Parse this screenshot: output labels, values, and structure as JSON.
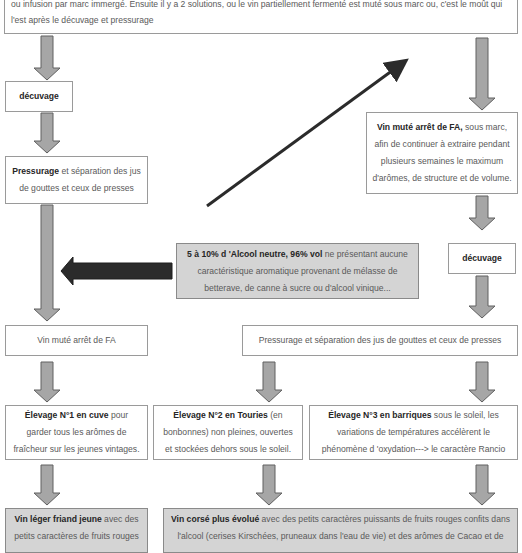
{
  "intro": {
    "text": "ou infusion par marc immergé. Ensuite il y a 2 solutions, ou le vin partiellement fermenté est muté sous marc ou, c'est le moût qui l'est après le décuvage et pressurage"
  },
  "left_branch": {
    "decuvage": "décuvage",
    "pressurage_bold": "Pressurage",
    "pressurage_rest": " et séparation des jus de gouttes et ceux de presses",
    "vin_mute": "Vin muté arrêt de FA"
  },
  "right_branch": {
    "vin_mute_bold": "Vin muté arrêt de FA,",
    "vin_mute_rest": " sous marc, afin de continuer à extraire pendant plusieurs semaines le maximum d'arômes, de structure et de volume.",
    "decuvage": "décuvage",
    "pressurage": "Pressurage et séparation des jus de gouttes et ceux de presses"
  },
  "alcool": {
    "bold": "5 à 10% d 'Alcool neutre, 96% vol",
    "rest": " ne présentant aucune caractéristique aromatique provenant de mélasse de betterave, de canne à sucre ou d'alcool vinique..."
  },
  "elevages": [
    {
      "bold": "Élevage N°1 en cuve",
      "rest": " pour garder tous les arômes de fraîcheur sur les jeunes vintages."
    },
    {
      "bold": "Élevage N°2 en Touries",
      "rest": " (en bonbonnes) non pleines, ouvertes et stockées dehors sous le soleil."
    },
    {
      "bold": "Élevage N°3 en barriques",
      "rest": " sous le soleil, les variations de températures accélèrent le phénomène d 'oxydation---> le caractère Rancio"
    }
  ],
  "results": [
    {
      "bold": "Vin léger friand jeune",
      "rest": " avec des petits caractères de fruits rouges"
    },
    {
      "bold": "Vin corsé plus évolué",
      "rest": " avec des petits caractères puissants de fruits rouges confits dans l'alcool (cerises Kirschées, pruneaux dans l'eau de vie) et des arômes de Cacao et de"
    }
  ],
  "colors": {
    "arrow_fill": "#a6a6a6",
    "arrow_stroke": "#606060",
    "dark_arrow": "#2b2b2b",
    "gray_box": "#d4d4d4"
  }
}
